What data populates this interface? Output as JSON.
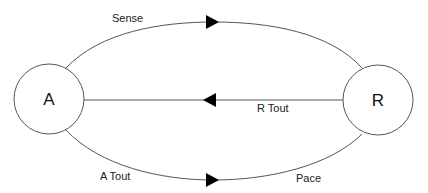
{
  "diagram": {
    "type": "state-machine",
    "nodes": [
      {
        "id": "A",
        "label": "A",
        "cx": 49,
        "cy": 99,
        "r": 35
      },
      {
        "id": "R",
        "label": "R",
        "cx": 378,
        "cy": 100,
        "r": 35
      }
    ],
    "edges": [
      {
        "id": "sense",
        "from": "A",
        "to": "R",
        "label": "Sense",
        "path": "top-arc"
      },
      {
        "id": "r-tout",
        "from": "R",
        "to": "A",
        "label": "R Tout",
        "path": "straight"
      },
      {
        "id": "a-tout-pace",
        "from": "A",
        "to": "R",
        "label_left": "A Tout",
        "label_right": "Pace",
        "path": "bottom-arc"
      }
    ],
    "colors": {
      "stroke": "#555555",
      "arrowhead": "#000000",
      "text": "#111111",
      "background": "#ffffff"
    }
  }
}
